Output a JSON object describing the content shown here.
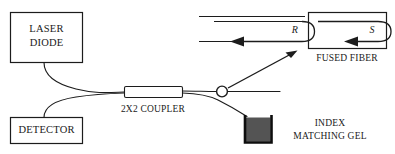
{
  "figure": {
    "background_color": "#ffffff",
    "line_color": "#1c1c1c",
    "gel_fill_color": "#545454"
  },
  "components": {
    "laser_diode": {
      "label_line1": "LASER",
      "label_line2": "DIODE"
    },
    "detector": {
      "label": "DETECTOR"
    },
    "coupler": {
      "label": "2X2 COUPLER"
    },
    "fused_fiber": {
      "label": "FUSED FIBER"
    },
    "index_matching_gel": {
      "label_line1": "INDEX",
      "label_line2": "MATCHING GEL"
    },
    "splice": {
      "name": "fiber-splice-point"
    }
  },
  "ray_labels": {
    "reference": "R",
    "signal": "S"
  }
}
